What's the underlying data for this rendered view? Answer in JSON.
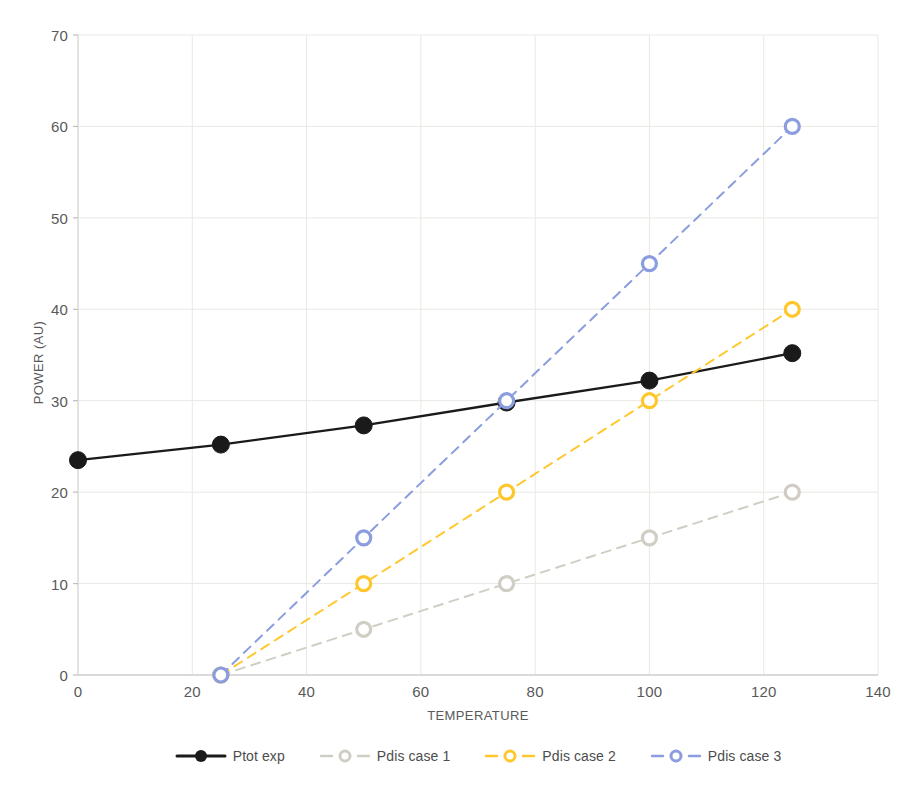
{
  "chart_data": {
    "type": "line",
    "title": "",
    "xlabel": "TEMPERATURE",
    "ylabel": "POWER (AU)",
    "xlim": [
      0,
      140
    ],
    "ylim": [
      0,
      70
    ],
    "xticks": [
      0,
      20,
      40,
      60,
      80,
      100,
      120,
      140
    ],
    "yticks": [
      0,
      10,
      20,
      30,
      40,
      50,
      60,
      70
    ],
    "grid": true,
    "legend_position": "bottom",
    "series": [
      {
        "name": "Ptot exp",
        "color": "#1a1a1a",
        "line_style": "solid",
        "marker": "filled-circle",
        "x": [
          0,
          25,
          50,
          75,
          100,
          125
        ],
        "y": [
          23.5,
          25.2,
          27.3,
          29.8,
          32.2,
          35.2
        ]
      },
      {
        "name": "Pdis case 1",
        "color": "#d0cec4",
        "line_style": "dashed",
        "marker": "hollow-circle",
        "x": [
          25,
          50,
          75,
          100,
          125
        ],
        "y": [
          0,
          5,
          10,
          15,
          20
        ]
      },
      {
        "name": "Pdis case 2",
        "color": "#ffc72c",
        "line_style": "dashed",
        "marker": "hollow-circle",
        "x": [
          25,
          50,
          75,
          100,
          125
        ],
        "y": [
          0,
          10,
          20,
          30,
          40
        ]
      },
      {
        "name": "Pdis case 3",
        "color": "#8b9dde",
        "line_style": "dashed",
        "marker": "hollow-circle",
        "x": [
          25,
          50,
          75,
          100,
          125
        ],
        "y": [
          0,
          15,
          30,
          45,
          60
        ]
      }
    ]
  },
  "axes": {
    "y_tick_labels": [
      "0",
      "10",
      "20",
      "30",
      "40",
      "50",
      "60",
      "70"
    ],
    "x_tick_labels": [
      "0",
      "20",
      "40",
      "60",
      "80",
      "100",
      "120",
      "140"
    ],
    "y_title": "POWER (AU)",
    "x_title": "TEMPERATURE"
  },
  "legend": {
    "items": [
      {
        "label": "Ptot exp",
        "color": "#1a1a1a"
      },
      {
        "label": "Pdis case 1",
        "color": "#d0cec4"
      },
      {
        "label": "Pdis case 2",
        "color": "#ffc72c"
      },
      {
        "label": "Pdis case 3",
        "color": "#8b9dde"
      }
    ]
  },
  "style": {
    "grid_color": "#e8e8e4",
    "axis_color": "#d9d9d9",
    "background": "#ffffff",
    "text_color": "#595959"
  }
}
